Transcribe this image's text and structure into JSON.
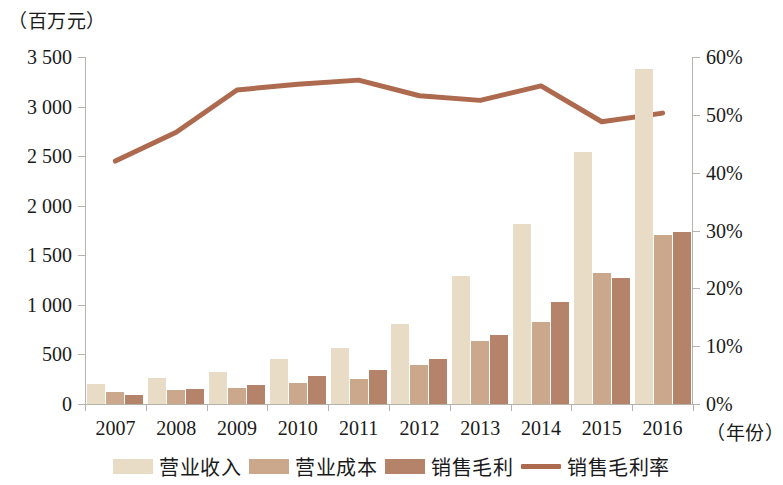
{
  "chart_data": {
    "type": "bar",
    "title": "",
    "subtitle": "",
    "xlabel": "（年份）",
    "ylabel": "（百万元）",
    "y2label": "",
    "categories": [
      "2007",
      "2008",
      "2009",
      "2010",
      "2011",
      "2012",
      "2013",
      "2014",
      "2015",
      "2016"
    ],
    "ylim": [
      0,
      3500
    ],
    "y_ticks": [
      "0",
      "500",
      "1 000",
      "1 500",
      "2 000",
      "2 500",
      "3 000",
      "3 500"
    ],
    "y_tick_values": [
      0,
      500,
      1000,
      1500,
      2000,
      2500,
      3000,
      3500
    ],
    "y2lim": [
      0,
      60
    ],
    "y2_ticks": [
      "0%",
      "10%",
      "20%",
      "30%",
      "40%",
      "50%",
      "60%"
    ],
    "y2_tick_values": [
      0,
      10,
      20,
      30,
      40,
      50,
      60
    ],
    "grid": false,
    "legend_position": "bottom",
    "series": [
      {
        "name": "营业收入",
        "kind": "bar",
        "axis": "left",
        "color": "#e9dcc6",
        "values": [
          205,
          265,
          320,
          455,
          570,
          810,
          1290,
          1820,
          2540,
          3380
        ]
      },
      {
        "name": "营业成本",
        "kind": "bar",
        "axis": "left",
        "color": "#cba78b",
        "values": [
          120,
          145,
          165,
          215,
          255,
          395,
          640,
          830,
          1320,
          1700
        ]
      },
      {
        "name": "销售毛利",
        "kind": "bar",
        "axis": "left",
        "color": "#b5836a",
        "values": [
          90,
          150,
          190,
          280,
          340,
          450,
          700,
          1030,
          1275,
          1730
        ]
      },
      {
        "name": "销售毛利率",
        "kind": "line",
        "axis": "right",
        "color": "#ad6a4e",
        "values": [
          42.0,
          47.0,
          54.3,
          55.3,
          56.0,
          53.3,
          52.5,
          55.0,
          48.8,
          50.3
        ]
      }
    ]
  },
  "legend": {
    "items": [
      {
        "label": "营业收入",
        "color": "#e9dcc6",
        "kind": "bar"
      },
      {
        "label": "营业成本",
        "color": "#cba78b",
        "kind": "bar"
      },
      {
        "label": "销售毛利",
        "color": "#b5836a",
        "kind": "bar"
      },
      {
        "label": "销售毛利率",
        "color": "#ad6a4e",
        "kind": "line"
      }
    ]
  }
}
